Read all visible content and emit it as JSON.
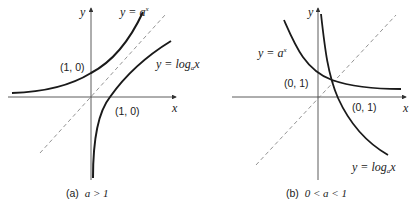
{
  "panels": [
    {
      "caption_prefix": "(a)",
      "caption_condition": "a > 1",
      "axis_x": "x",
      "axis_y": "y",
      "exp_label_pre": "y = a",
      "exp_label_sup": "x",
      "log_label_pre": "y = log",
      "log_label_sub": "a",
      "log_label_post": "x",
      "point_exp": "(1, 0)",
      "point_log": "(1, 0)"
    },
    {
      "caption_prefix": "(b)",
      "caption_condition": "0 < a < 1",
      "axis_x": "x",
      "axis_y": "y",
      "exp_label_pre": "y = a",
      "exp_label_sup": "x",
      "log_label_pre": "y = log",
      "log_label_sub": "a",
      "log_label_post": "x",
      "point_exp": "(0, 1)",
      "point_log": "(0, 1)"
    }
  ],
  "colors": {
    "curve": "#1a1a1a",
    "axis": "#333333",
    "dashed": "#777777"
  }
}
